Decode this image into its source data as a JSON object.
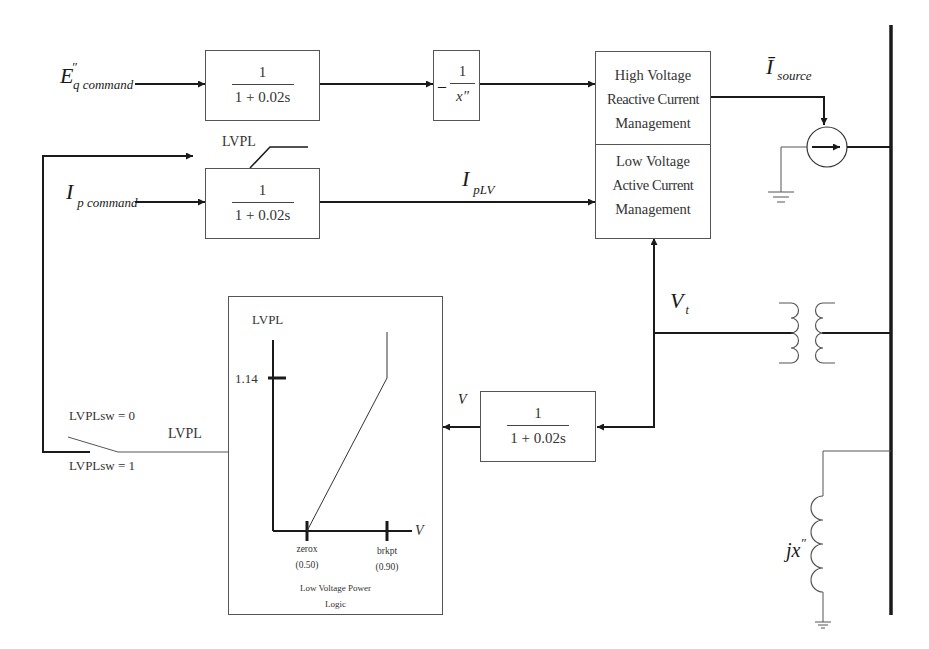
{
  "diagram": {
    "inputs": {
      "eq_command": {
        "main": "E",
        "superscript": "″",
        "subscript": "q command"
      },
      "ip_command": {
        "main": "I",
        "subscript": "p command"
      }
    },
    "blocks": {
      "eq_filter": {
        "numerator": "1",
        "denominator": "1 + 0.02s"
      },
      "neg_inv_x": {
        "sign": "–",
        "numerator": "1",
        "denominator": "x″"
      },
      "ip_filter": {
        "numerator": "1",
        "denominator": "1 + 0.02s",
        "limit_label": "LVPL"
      },
      "v_filter": {
        "numerator": "1",
        "denominator": "1 + 0.02s"
      },
      "hv_reactive": {
        "lines": [
          "High Voltage",
          "Reactive Current",
          "Management"
        ]
      },
      "lv_active": {
        "lines": [
          "Low Voltage",
          "Active Current",
          "Management"
        ]
      }
    },
    "signals": {
      "iplv": {
        "main": "I",
        "subscript": "pLV"
      },
      "isource": {
        "main": "Ī",
        "subscript": "source"
      },
      "vt": {
        "main": "V",
        "subscript": "t"
      },
      "v": "V"
    },
    "lvpl_logic": {
      "y_axis_label": "LVPL",
      "x_axis_label": "V",
      "y_tick": "1.14",
      "x_ticks": [
        {
          "name": "zerox",
          "value": "(0.50)"
        },
        {
          "name": "brkpt",
          "value": "(0.90)"
        }
      ],
      "caption_lines": [
        "Low Voltage Power",
        "Logic"
      ]
    },
    "switch": {
      "label_sw0": "LVPLsw = 0",
      "label_sw1": "LVPLsw = 1",
      "output_label": "LVPL"
    },
    "network": {
      "reactance": {
        "main": "jx",
        "superscript": "″"
      }
    },
    "colors": {
      "line": "#1a1a1a",
      "thin_line": "#555555",
      "background": "#ffffff"
    }
  }
}
